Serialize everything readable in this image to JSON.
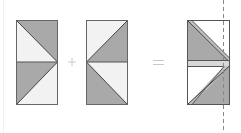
{
  "diagram": {
    "operators": {
      "plus": "+",
      "equals": "="
    },
    "colors": {
      "dark_fill": "#a9a9a9",
      "light_fill": "#f2f2f2",
      "outline": "#555555",
      "dashed_line": "#888888",
      "operator": "#bbbbbb"
    },
    "figures": [
      {
        "id": "left-rectangle",
        "top_triangle_dark": "upper-right",
        "bottom_triangle_dark": "upper-left"
      },
      {
        "id": "middle-rectangle",
        "top_triangle_dark": "lower-right",
        "bottom_triangle_dark": "lower-left"
      },
      {
        "id": "result-rectangle",
        "has_dashed_fold_line": true
      }
    ]
  }
}
